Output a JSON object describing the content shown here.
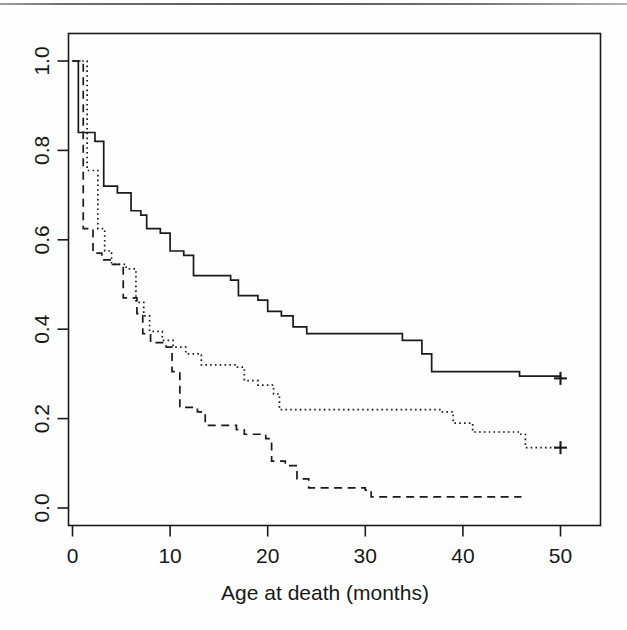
{
  "figure": {
    "name": "kaplan-meier-survival-plot",
    "background_color": "#fefefe",
    "ink_color": "#1a1a1a"
  },
  "chart_data": {
    "type": "line",
    "subtype": "kaplan-meier-step",
    "title": "",
    "subtitle": "",
    "xlabel": "Age at death (months)",
    "ylabel": "",
    "xlim": [
      0,
      50
    ],
    "ylim": [
      0.0,
      1.0
    ],
    "xticks": [
      0,
      10,
      20,
      30,
      40,
      50
    ],
    "xtick_labels": [
      "0",
      "10",
      "20",
      "30",
      "40",
      "50"
    ],
    "yticks": [
      0.0,
      0.2,
      0.4,
      0.6,
      0.8,
      1.0
    ],
    "ytick_labels": [
      "0.0",
      "0.2",
      "0.4",
      "0.6",
      "0.8",
      "1.0"
    ],
    "grid": false,
    "legend": "none",
    "y_axis_label_rotation": "vertical",
    "box_border": true,
    "series": [
      {
        "name": "group-1-solid",
        "style": "solid",
        "color": "#1a1a1a",
        "censor_marker": "+",
        "censor_points": [
          [
            50,
            0.29
          ]
        ],
        "steps": [
          [
            0,
            1.0
          ],
          [
            0.6,
            0.84
          ],
          [
            2.3,
            0.82
          ],
          [
            3.2,
            0.72
          ],
          [
            4.6,
            0.705
          ],
          [
            6.0,
            0.665
          ],
          [
            7.0,
            0.655
          ],
          [
            7.6,
            0.625
          ],
          [
            9.0,
            0.615
          ],
          [
            10.0,
            0.575
          ],
          [
            11.4,
            0.565
          ],
          [
            12.4,
            0.52
          ],
          [
            16.2,
            0.51
          ],
          [
            17.0,
            0.475
          ],
          [
            19.0,
            0.465
          ],
          [
            20.0,
            0.44
          ],
          [
            21.4,
            0.43
          ],
          [
            22.6,
            0.405
          ],
          [
            24.0,
            0.39
          ],
          [
            33.8,
            0.375
          ],
          [
            35.8,
            0.345
          ],
          [
            36.8,
            0.305
          ],
          [
            45.8,
            0.295
          ],
          [
            50,
            0.29
          ]
        ]
      },
      {
        "name": "group-2-dotted",
        "style": "dotted",
        "color": "#1a1a1a",
        "censor_marker": "+",
        "censor_points": [
          [
            50,
            0.135
          ]
        ],
        "steps": [
          [
            0,
            1.0
          ],
          [
            1.5,
            0.755
          ],
          [
            2.6,
            0.625
          ],
          [
            3.3,
            0.575
          ],
          [
            4.0,
            0.545
          ],
          [
            5.5,
            0.535
          ],
          [
            6.5,
            0.46
          ],
          [
            7.3,
            0.43
          ],
          [
            7.9,
            0.395
          ],
          [
            9.2,
            0.375
          ],
          [
            10.3,
            0.36
          ],
          [
            11.6,
            0.345
          ],
          [
            13.2,
            0.32
          ],
          [
            16.8,
            0.315
          ],
          [
            17.6,
            0.285
          ],
          [
            19.0,
            0.275
          ],
          [
            20.6,
            0.255
          ],
          [
            21.2,
            0.22
          ],
          [
            37.8,
            0.215
          ],
          [
            39.0,
            0.19
          ],
          [
            41.0,
            0.17
          ],
          [
            45.8,
            0.165
          ],
          [
            46.4,
            0.135
          ],
          [
            50,
            0.135
          ]
        ]
      },
      {
        "name": "group-3-dashed",
        "style": "dashed",
        "color": "#1a1a1a",
        "censor_marker": "none",
        "censor_points": [],
        "steps": [
          [
            0,
            1.0
          ],
          [
            1.1,
            0.625
          ],
          [
            2.1,
            0.57
          ],
          [
            3.0,
            0.555
          ],
          [
            4.1,
            0.545
          ],
          [
            5.2,
            0.47
          ],
          [
            6.6,
            0.435
          ],
          [
            7.2,
            0.39
          ],
          [
            8.0,
            0.37
          ],
          [
            9.6,
            0.36
          ],
          [
            10.2,
            0.305
          ],
          [
            11.0,
            0.225
          ],
          [
            12.8,
            0.215
          ],
          [
            13.6,
            0.185
          ],
          [
            16.8,
            0.175
          ],
          [
            17.6,
            0.165
          ],
          [
            19.8,
            0.155
          ],
          [
            20.4,
            0.105
          ],
          [
            21.8,
            0.095
          ],
          [
            23.0,
            0.065
          ],
          [
            24.2,
            0.045
          ],
          [
            30.0,
            0.04
          ],
          [
            30.6,
            0.025
          ],
          [
            46.0,
            0.025
          ]
        ]
      }
    ]
  },
  "axes": {
    "x_title": "Age at death (months)",
    "x_tick_labels": [
      "0",
      "10",
      "20",
      "30",
      "40",
      "50"
    ],
    "y_tick_labels": [
      "0.0",
      "0.2",
      "0.4",
      "0.6",
      "0.8",
      "1.0"
    ]
  }
}
